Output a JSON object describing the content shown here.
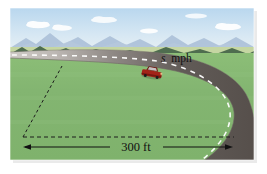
{
  "figure": {
    "name": "car-on-curve-illustration",
    "type": "perspective-diagram",
    "caption": "",
    "labels": {
      "speed_symbol": "s",
      "speed_units": "mph",
      "radius_value": "300 ft"
    },
    "colors": {
      "sky_top": "#bcd9ef",
      "sky_bottom": "#e3eef6",
      "cloud": "#ffffff",
      "mountain_far": "#9bb2cf",
      "mountain_near": "#4e6b50",
      "grass_far": "#8fc07a",
      "grass_near": "#7cb06a",
      "horizon_band": "#c9d69a",
      "road_near": "#5a5450",
      "road_far": "#d8d4d0",
      "road_edge": "#6f6a66",
      "lane_dash": "#ffffff",
      "car_body": "#a32318",
      "car_top": "#6e1710",
      "car_glass": "#d6d2cc",
      "guide_line": "#1c1c1c",
      "text": "#111111",
      "page_background": "#ffffff"
    },
    "geometry": {
      "radius_line": {
        "from": [
          62,
          66
        ],
        "to": [
          23,
          137
        ],
        "style": "dashed"
      },
      "horizontal_guide": {
        "from": [
          23,
          137
        ],
        "to": [
          232,
          137
        ],
        "style": "dashed"
      },
      "dimension_arrow": {
        "from": [
          23,
          147
        ],
        "to": [
          232,
          147
        ],
        "style": "solid-double-arrow",
        "label": "300 ft"
      }
    },
    "elements": [
      {
        "name": "sky",
        "description": "light blue sky with scattered white clouds"
      },
      {
        "name": "clouds",
        "count": 5
      },
      {
        "name": "distant-mountains",
        "description": "pale blue mountain range on horizon"
      },
      {
        "name": "near-hills",
        "description": "dark green foothills"
      },
      {
        "name": "grass-field",
        "description": "green field filling foreground"
      },
      {
        "name": "road",
        "description": "two-lane road sweeping from left then curving right and down"
      },
      {
        "name": "lane-dashes",
        "description": "white dashed centerline"
      },
      {
        "name": "car",
        "description": "small red car travelling on the road"
      },
      {
        "name": "speed-label",
        "text": "s mph"
      },
      {
        "name": "radius-dashed-line",
        "description": "dashed line from curve center to road"
      },
      {
        "name": "dimension-line",
        "text": "300 ft"
      }
    ]
  }
}
